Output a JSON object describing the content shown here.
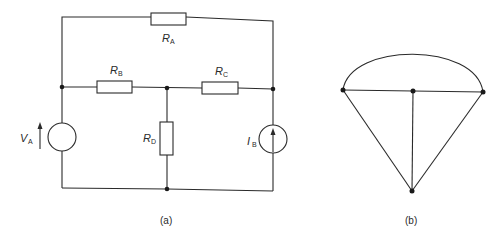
{
  "figure_a": {
    "caption": "(a)",
    "components": {
      "RA": {
        "symbol": "R",
        "subscript": "A",
        "type": "resistor"
      },
      "RB": {
        "symbol": "R",
        "subscript": "B",
        "type": "resistor"
      },
      "RC": {
        "symbol": "R",
        "subscript": "C",
        "type": "resistor"
      },
      "RD": {
        "symbol": "R",
        "subscript": "D",
        "type": "resistor"
      },
      "VA": {
        "symbol": "V",
        "subscript": "A",
        "type": "voltage-source"
      },
      "IB": {
        "symbol": "I",
        "subscript": "B",
        "type": "current-source"
      }
    }
  },
  "figure_b": {
    "caption": "(b)",
    "description": "graph of circuit (a): 4 nodes, 6 branches"
  }
}
